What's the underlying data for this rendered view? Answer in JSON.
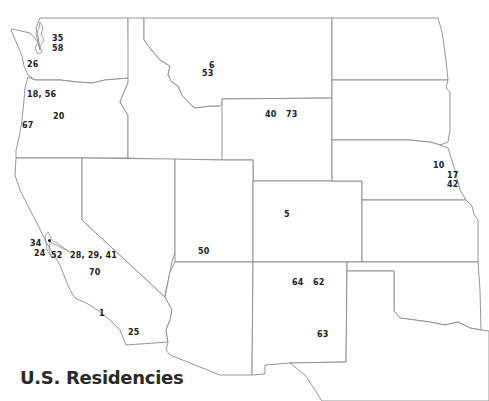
{
  "title": "U.S. Residencies",
  "colors": {
    "state_stroke": "#8a8a8a",
    "label": "#222222",
    "background": "#ffffff"
  },
  "states": [
    "Washington",
    "Oregon",
    "California",
    "Idaho",
    "Nevada",
    "Montana",
    "Wyoming",
    "Utah",
    "Arizona",
    "Colorado",
    "New Mexico",
    "North Dakota",
    "South Dakota",
    "Nebraska",
    "Kansas",
    "Oklahoma",
    "Texas"
  ],
  "labels": [
    {
      "id": "wa-35",
      "state": "Washington",
      "text": "35",
      "x": 52,
      "y": 34
    },
    {
      "id": "wa-58",
      "state": "Washington",
      "text": "58",
      "x": 52,
      "y": 44
    },
    {
      "id": "wa-26",
      "state": "Washington",
      "text": "26",
      "x": 27,
      "y": 60
    },
    {
      "id": "or-18-56",
      "state": "Oregon",
      "text": "18, 56",
      "x": 27,
      "y": 90
    },
    {
      "id": "or-20",
      "state": "Oregon",
      "text": "20",
      "x": 53,
      "y": 112
    },
    {
      "id": "or-67",
      "state": "Oregon",
      "text": "67",
      "x": 22,
      "y": 121
    },
    {
      "id": "mt-6",
      "state": "Montana",
      "text": "6",
      "x": 209,
      "y": 61
    },
    {
      "id": "mt-53",
      "state": "Montana",
      "text": "53",
      "x": 202,
      "y": 69
    },
    {
      "id": "wy-40",
      "state": "Wyoming",
      "text": "40",
      "x": 265,
      "y": 110
    },
    {
      "id": "wy-73",
      "state": "Wyoming",
      "text": "73",
      "x": 286,
      "y": 110
    },
    {
      "id": "ne-10",
      "state": "Nebraska",
      "text": "10",
      "x": 433,
      "y": 161
    },
    {
      "id": "ne-17",
      "state": "Nebraska",
      "text": "17",
      "x": 447,
      "y": 171
    },
    {
      "id": "ne-42",
      "state": "Nebraska",
      "text": "42",
      "x": 447,
      "y": 180
    },
    {
      "id": "co-5",
      "state": "Colorado",
      "text": "5",
      "x": 284,
      "y": 210
    },
    {
      "id": "ut-50",
      "state": "Utah",
      "text": "50",
      "x": 198,
      "y": 247
    },
    {
      "id": "ca-34",
      "state": "California",
      "text": "34",
      "x": 30,
      "y": 239
    },
    {
      "id": "ca-24",
      "state": "California",
      "text": "24",
      "x": 34,
      "y": 249
    },
    {
      "id": "ca-52",
      "state": "California",
      "text": "52",
      "x": 51,
      "y": 251
    },
    {
      "id": "ca-28-29-41",
      "state": "California",
      "text": "28, 29, 41",
      "x": 70,
      "y": 251
    },
    {
      "id": "ca-70",
      "state": "California",
      "text": "70",
      "x": 89,
      "y": 268
    },
    {
      "id": "ca-1",
      "state": "California",
      "text": "1",
      "x": 99,
      "y": 309
    },
    {
      "id": "ca-25",
      "state": "California",
      "text": "25",
      "x": 128,
      "y": 328
    },
    {
      "id": "nm-64",
      "state": "New Mexico",
      "text": "64",
      "x": 292,
      "y": 278
    },
    {
      "id": "nm-62",
      "state": "New Mexico",
      "text": "62",
      "x": 313,
      "y": 278
    },
    {
      "id": "nm-63",
      "state": "New Mexico",
      "text": "63",
      "x": 317,
      "y": 330
    }
  ],
  "markers": [
    {
      "id": "sf-bay-dot",
      "x": 49,
      "y": 240
    }
  ]
}
